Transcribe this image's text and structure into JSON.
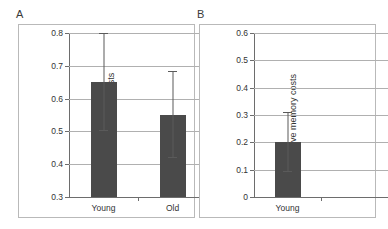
{
  "figure": {
    "background": "#ffffff",
    "bar_color": "#4a4a4a",
    "grid_color": "#b0b0b0",
    "axis_color": "#6d6d6d",
    "frame_color": "#b9b9b9"
  },
  "panels": [
    {
      "letter": "A",
      "chart_data": {
        "type": "bar",
        "title": "",
        "xlabel": "",
        "ylabel": "Absolute memory costs",
        "categories": [
          "Young",
          "Old"
        ],
        "values": [
          0.65,
          0.55
        ],
        "error_upper": [
          0.8,
          0.685
        ],
        "error_lower": [
          0.5,
          0.42
        ],
        "ylim": [
          0.3,
          0.8
        ],
        "yticks": [
          0.3,
          0.4,
          0.5,
          0.6,
          0.7,
          0.8
        ],
        "ytick_labels": [
          "0.3",
          "0.4",
          "0.5",
          "0.6",
          "0.7",
          "0.8"
        ],
        "grid": true,
        "legend": "none"
      }
    },
    {
      "letter": "B",
      "chart_data": {
        "type": "bar",
        "title": "",
        "xlabel": "",
        "ylabel": "Relative memory costs",
        "categories": [
          "Young"
        ],
        "values": [
          0.2
        ],
        "error_upper": [
          0.31
        ],
        "error_lower": [
          0.09
        ],
        "ylim": [
          0,
          0.6
        ],
        "yticks": [
          0,
          0.1,
          0.2,
          0.3,
          0.4,
          0.5,
          0.6
        ],
        "ytick_labels": [
          "0",
          "0.1",
          "0.2",
          "0.3",
          "0.4",
          "0.5",
          "0.6"
        ],
        "grid": true,
        "legend": "none"
      }
    }
  ]
}
